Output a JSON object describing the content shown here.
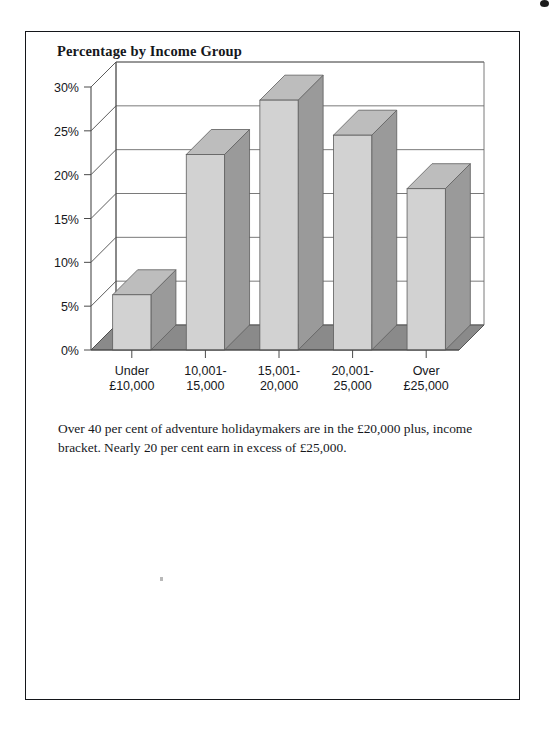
{
  "page": {
    "title": "Percentage by Income Group",
    "caption": "Over 40 per cent of adventure holidaymakers are in the £20,000 plus, income bracket. Nearly 20 per cent earn in excess of £25,000."
  },
  "chart_data": {
    "type": "bar",
    "title": "Percentage by Income Group",
    "categories": [
      "Under £10,000",
      "10,001-15,000",
      "15,001-20,000",
      "20,001-25,000",
      "Over £25,000"
    ],
    "category_lines": [
      [
        "Under",
        "£10,000"
      ],
      [
        "10,001-",
        "15,000"
      ],
      [
        "15,001-",
        "20,000"
      ],
      [
        "20,001-",
        "25,000"
      ],
      [
        "Over",
        "£25,000"
      ]
    ],
    "values": [
      6.3,
      22.3,
      28.5,
      24.5,
      18.4
    ],
    "xlabel": "",
    "ylabel": "",
    "ylim": [
      0,
      30
    ],
    "ytick_values": [
      0,
      5,
      10,
      15,
      20,
      25,
      30
    ],
    "ytick_labels": [
      "0%",
      "5%",
      "10%",
      "15%",
      "20%",
      "25%",
      "30%"
    ],
    "grid": true,
    "legend": false,
    "style": "3d-column",
    "colors": {
      "bar_front": "#d2d2d2",
      "bar_side": "#9a9a9a",
      "bar_top": "#bdbdbd",
      "floor": "#8a8a8a",
      "wall": "#ffffff",
      "axis": "#4a4a4a",
      "grid": "#6b6b6b",
      "text": "#16181c"
    }
  }
}
